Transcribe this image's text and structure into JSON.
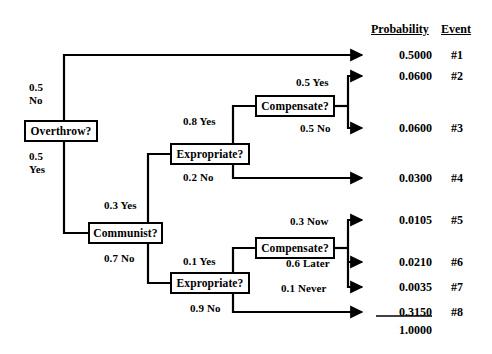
{
  "diagram": {
    "headers": {
      "probability": "Probability",
      "event": "Event"
    },
    "nodes": [
      {
        "id": "overthrow",
        "label": "Overthrow?",
        "x": 24,
        "y": 120,
        "w": 74,
        "h": 22
      },
      {
        "id": "expropriate1",
        "label": "Expropriate?",
        "x": 170,
        "y": 143,
        "w": 80,
        "h": 22
      },
      {
        "id": "compensate1",
        "label": "Compensate?",
        "x": 255,
        "y": 95,
        "w": 80,
        "h": 22
      },
      {
        "id": "communist",
        "label": "Communist?",
        "x": 88,
        "y": 222,
        "w": 75,
        "h": 22
      },
      {
        "id": "expropriate2",
        "label": "Expropriate?",
        "x": 170,
        "y": 272,
        "w": 80,
        "h": 22
      },
      {
        "id": "compensate2",
        "label": "Compensate?",
        "x": 255,
        "y": 237,
        "w": 80,
        "h": 22
      }
    ],
    "branch_labels": [
      {
        "id": "overthrow-no",
        "text": "0.5\nNo",
        "x": 29,
        "y": 81
      },
      {
        "id": "overthrow-yes",
        "text": "0.5\nYes",
        "x": 29,
        "y": 150
      },
      {
        "id": "expropriate1-yes",
        "text": "0.8 Yes",
        "x": 183,
        "y": 115
      },
      {
        "id": "expropriate1-no",
        "text": "0.2 No",
        "x": 183,
        "y": 171
      },
      {
        "id": "compensate1-yes",
        "text": "0.5 Yes",
        "x": 296,
        "y": 76
      },
      {
        "id": "compensate1-no",
        "text": "0.5 No",
        "x": 300,
        "y": 122
      },
      {
        "id": "communist-yes",
        "text": "0.3 Yes",
        "x": 104,
        "y": 199
      },
      {
        "id": "communist-no",
        "text": "0.7 No",
        "x": 104,
        "y": 252
      },
      {
        "id": "expropriate2-yes",
        "text": "0.1 Yes",
        "x": 183,
        "y": 255
      },
      {
        "id": "expropriate2-no",
        "text": "0.9 No",
        "x": 190,
        "y": 302
      },
      {
        "id": "compensate2-now",
        "text": "0.3 Now",
        "x": 290,
        "y": 215
      },
      {
        "id": "compensate2-later",
        "text": "0.6 Later",
        "x": 286,
        "y": 257
      },
      {
        "id": "compensate2-never",
        "text": "0.1 Never",
        "x": 281,
        "y": 282
      }
    ],
    "outcomes": [
      {
        "probability": "0.5000",
        "event": "#1",
        "y": 48
      },
      {
        "probability": "0.0600",
        "event": "#2",
        "y": 69
      },
      {
        "probability": "0.0600",
        "event": "#3",
        "y": 121
      },
      {
        "probability": "0.0300",
        "event": "#4",
        "y": 171
      },
      {
        "probability": "0.0105",
        "event": "#5",
        "y": 213
      },
      {
        "probability": "0.0210",
        "event": "#6",
        "y": 255
      },
      {
        "probability": "0.0035",
        "event": "#7",
        "y": 280
      },
      {
        "probability": "0.3150",
        "event": "#8",
        "y": 305,
        "underline": true
      }
    ],
    "total": {
      "value": "1.0000",
      "y": 323
    }
  }
}
